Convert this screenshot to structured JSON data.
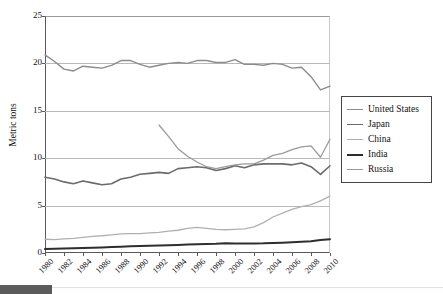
{
  "chart_data": {
    "type": "line",
    "title": "",
    "xlabel": "",
    "ylabel": "Metric tons",
    "xlim": [
      1980,
      2010
    ],
    "ylim": [
      0,
      25
    ],
    "ytick_labels": [
      "0",
      "5",
      "10",
      "15",
      "20",
      "25"
    ],
    "ytick_values": [
      0,
      5,
      10,
      15,
      20,
      25
    ],
    "grid": "horizontal",
    "legend_position": "right",
    "x": [
      1980,
      1981,
      1982,
      1983,
      1984,
      1985,
      1986,
      1987,
      1988,
      1989,
      1990,
      1991,
      1992,
      1993,
      1994,
      1995,
      1996,
      1997,
      1998,
      1999,
      2000,
      2001,
      2002,
      2003,
      2004,
      2005,
      2006,
      2007,
      2008,
      2009,
      2010
    ],
    "xtick_labels": [
      "1980",
      "1982",
      "1984",
      "1986",
      "1988",
      "1990",
      "1992",
      "1994",
      "1996",
      "1998",
      "2000",
      "2002",
      "2004",
      "2006",
      "2008",
      "2010"
    ],
    "xtick_values": [
      1980,
      1982,
      1984,
      1986,
      1988,
      1990,
      1992,
      1994,
      1996,
      1998,
      2000,
      2002,
      2004,
      2006,
      2008,
      2010
    ],
    "series": [
      {
        "name": "United States",
        "color": "#8c8c8c",
        "width": 1.4,
        "values": [
          20.9,
          20.2,
          19.4,
          19.2,
          19.7,
          19.6,
          19.5,
          19.8,
          20.3,
          20.3,
          19.9,
          19.6,
          19.8,
          20.0,
          20.1,
          20.0,
          20.3,
          20.3,
          20.1,
          20.1,
          20.4,
          19.9,
          19.9,
          19.8,
          20.0,
          19.9,
          19.5,
          19.6,
          18.6,
          17.2,
          17.6
        ]
      },
      {
        "name": "Japan",
        "color": "#6b6b6b",
        "width": 1.6,
        "values": [
          8.0,
          7.8,
          7.5,
          7.3,
          7.6,
          7.4,
          7.2,
          7.3,
          7.8,
          8.0,
          8.3,
          8.4,
          8.5,
          8.4,
          8.9,
          9.0,
          9.1,
          9.0,
          8.7,
          8.9,
          9.2,
          9.0,
          9.3,
          9.4,
          9.4,
          9.4,
          9.3,
          9.5,
          9.1,
          8.3,
          9.2
        ]
      },
      {
        "name": "China",
        "color": "#b0b0b0",
        "width": 1.3,
        "values": [
          1.45,
          1.42,
          1.48,
          1.55,
          1.65,
          1.75,
          1.82,
          1.92,
          2.02,
          2.05,
          2.05,
          2.12,
          2.18,
          2.3,
          2.4,
          2.6,
          2.7,
          2.6,
          2.5,
          2.45,
          2.5,
          2.55,
          2.75,
          3.2,
          3.8,
          4.2,
          4.6,
          4.9,
          5.1,
          5.5,
          6.0
        ]
      },
      {
        "name": "India",
        "color": "#2e2e2e",
        "width": 2.0,
        "values": [
          0.42,
          0.45,
          0.47,
          0.49,
          0.52,
          0.56,
          0.58,
          0.62,
          0.66,
          0.7,
          0.73,
          0.76,
          0.79,
          0.81,
          0.85,
          0.9,
          0.93,
          0.96,
          0.97,
          1.02,
          1.01,
          1.0,
          1.01,
          1.02,
          1.06,
          1.09,
          1.13,
          1.19,
          1.25,
          1.36,
          1.45
        ]
      },
      {
        "name": "Russia",
        "color": "#9a9a9a",
        "width": 1.3,
        "values": [
          null,
          null,
          null,
          null,
          null,
          null,
          null,
          null,
          null,
          null,
          null,
          null,
          13.5,
          12.3,
          11.0,
          10.2,
          9.6,
          9.1,
          8.9,
          9.1,
          9.3,
          9.4,
          9.4,
          9.8,
          10.3,
          10.5,
          10.9,
          11.2,
          11.3,
          10.1,
          12.0
        ]
      }
    ]
  },
  "legend": {
    "entries": [
      {
        "label": "United States"
      },
      {
        "label": "Japan"
      },
      {
        "label": "China"
      },
      {
        "label": "India"
      },
      {
        "label": "Russia"
      }
    ]
  },
  "bottom_bar": {
    "thumb_color": "#5b5b5b"
  }
}
